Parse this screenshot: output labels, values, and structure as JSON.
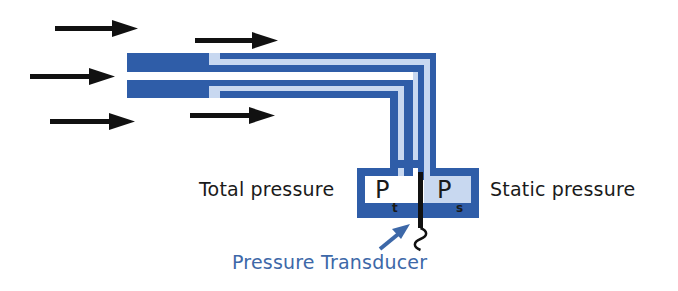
{
  "diagram": {
    "colors": {
      "tube_dark": "#2f5da8",
      "tube_light": "#c8d8f0",
      "arrow": "#111111",
      "label_text": "#1a1a1a",
      "transducer_label": "#3d68a8"
    },
    "labels": {
      "total_pressure": "Total pressure",
      "static_pressure": "Static pressure",
      "transducer": "Pressure Transducer"
    },
    "chambers": {
      "total": {
        "symbol": "P",
        "subscript": "t"
      },
      "static": {
        "symbol": "P",
        "subscript": "s"
      }
    },
    "flow_arrows": [
      {
        "name": "flow-arrow-1",
        "x1": 55,
        "x2": 138,
        "y": 28
      },
      {
        "name": "flow-arrow-2",
        "x1": 195,
        "x2": 278,
        "y": 40
      },
      {
        "name": "flow-arrow-3",
        "x1": 30,
        "x2": 115,
        "y": 76
      },
      {
        "name": "flow-arrow-4",
        "x1": 190,
        "x2": 275,
        "y": 115
      },
      {
        "name": "flow-arrow-5",
        "x1": 50,
        "x2": 135,
        "y": 121
      }
    ]
  }
}
